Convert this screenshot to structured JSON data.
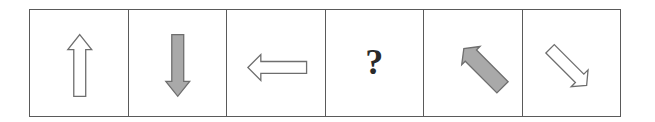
{
  "puzzle": {
    "cells": [
      {
        "type": "arrow",
        "direction": "up",
        "fill": "white",
        "icon": "arrow-up-outline-icon"
      },
      {
        "type": "arrow",
        "direction": "down",
        "fill": "gray",
        "icon": "arrow-down-filled-icon"
      },
      {
        "type": "arrow",
        "direction": "left",
        "fill": "white",
        "icon": "arrow-left-outline-icon"
      },
      {
        "type": "unknown",
        "label": "?"
      },
      {
        "type": "arrow",
        "direction": "up-left",
        "fill": "gray",
        "icon": "arrow-up-left-filled-icon"
      },
      {
        "type": "arrow",
        "direction": "down-right",
        "fill": "white",
        "icon": "arrow-down-right-outline-icon"
      }
    ],
    "colors": {
      "border": "#5a5a5a",
      "arrow_stroke": "#6e6e6e",
      "arrow_gray_fill": "#a9a9a9",
      "arrow_white_fill": "#ffffff",
      "question_mark": "#2a2a2a"
    }
  }
}
